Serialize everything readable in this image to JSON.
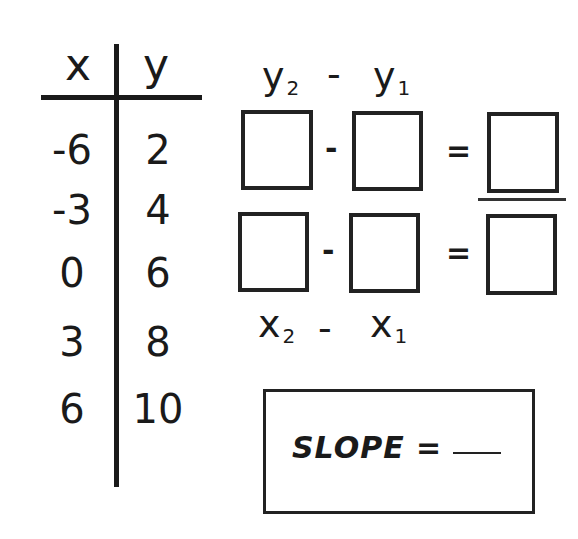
{
  "table": {
    "headers": {
      "x": "x",
      "y": "y"
    },
    "rows": [
      {
        "x": "-6",
        "y": "2"
      },
      {
        "x": "-3",
        "y": "4"
      },
      {
        "x": "0",
        "y": "6"
      },
      {
        "x": "3",
        "y": "8"
      },
      {
        "x": "6",
        "y": "10"
      }
    ]
  },
  "formula": {
    "top": {
      "term1": "y",
      "sub1": "2",
      "minus": "-",
      "term2": "y",
      "sub2": "1"
    },
    "bottom": {
      "term1": "x",
      "sub1": "2",
      "minus": "-",
      "term2": "x",
      "sub2": "1"
    },
    "minus_sign": "-",
    "equals_sign": "="
  },
  "slope": {
    "label": "SLOPE ="
  }
}
